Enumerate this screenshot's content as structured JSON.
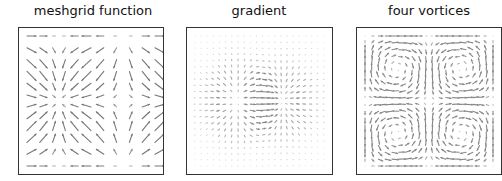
{
  "chart_data": [
    {
      "type": "quiver",
      "title": "meshgrid function",
      "field": "meshgrid",
      "x": {
        "min": 0,
        "max": 6.28,
        "n": 11
      },
      "y": {
        "min": 0,
        "max": 6.28,
        "n": 12
      },
      "xlabel": "",
      "ylabel": "",
      "grid": false,
      "arrow_color": "#777777"
    },
    {
      "type": "quiver",
      "title": "gradient",
      "field": "gradient",
      "x": {
        "min": -2,
        "max": 2,
        "n": 22
      },
      "y": {
        "min": -2,
        "max": 2,
        "n": 22
      },
      "xlabel": "",
      "ylabel": "",
      "grid": false,
      "arrow_color": "#888888"
    },
    {
      "type": "quiver",
      "title": "four vortices",
      "field": "four_vortices",
      "x": {
        "min": 0,
        "max": 1,
        "n": 20
      },
      "y": {
        "min": 0,
        "max": 1,
        "n": 20
      },
      "xlabel": "",
      "ylabel": "",
      "grid": false,
      "arrow_color": "#888888"
    }
  ]
}
